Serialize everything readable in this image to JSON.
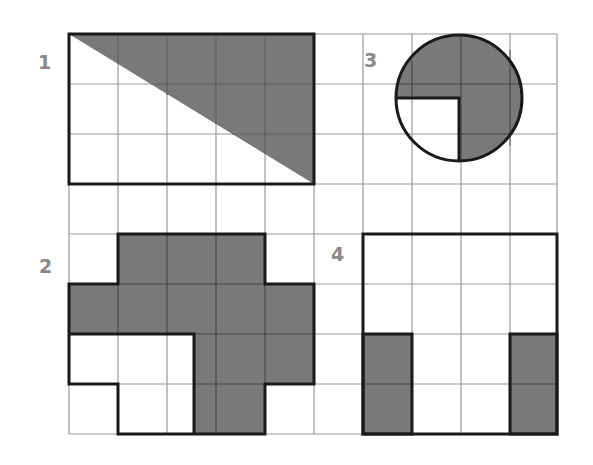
{
  "figure": {
    "grid": {
      "x0": 69,
      "y0": 34,
      "cols": 10,
      "rows": 8,
      "cell_w": 48.9,
      "cell_h": 50,
      "line_color": "#9a9a9a"
    },
    "colors": {
      "shade": "#6e6e6e",
      "outline": "#1a1a1a",
      "label": "#8a8a8a",
      "background": "#ffffff"
    },
    "labels": [
      {
        "id": "1",
        "text": "1",
        "x": 38,
        "y": 53
      },
      {
        "id": "2",
        "text": "2",
        "x": 39,
        "y": 257
      },
      {
        "id": "3",
        "text": "3",
        "x": 364,
        "y": 51
      },
      {
        "id": "4",
        "text": "4",
        "x": 331,
        "y": 245
      }
    ],
    "shapes": [
      {
        "id": "1",
        "type": "rectangle-with-triangle",
        "outline": "5x3 rectangle",
        "shaded": "upper-right triangle above the diagonal from top-left to bottom-right"
      },
      {
        "id": "2",
        "type": "polyomino",
        "shaded": "cross-like shape with half-cell offset stem",
        "outline": "includes unshaded lower-left region"
      },
      {
        "id": "3",
        "type": "circle",
        "shaded": "three quarters of circle",
        "unshaded": "lower-left quarter"
      },
      {
        "id": "4",
        "type": "rectangle",
        "outline": "4x4 square",
        "shaded": "two 1x2 columns at bottom-left and bottom-right"
      }
    ]
  }
}
